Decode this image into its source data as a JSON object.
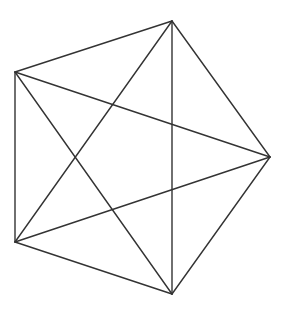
{
  "figure": {
    "stroke_color": "#333333",
    "background": "#ffffff",
    "vertices": [
      {
        "id": "A",
        "x": 172,
        "y": 21
      },
      {
        "id": "B",
        "x": 15,
        "y": 72
      },
      {
        "id": "C",
        "x": 15,
        "y": 242
      },
      {
        "id": "D",
        "x": 172,
        "y": 294
      },
      {
        "id": "E",
        "x": 270,
        "y": 157
      }
    ],
    "sides": [
      [
        "A",
        "B"
      ],
      [
        "B",
        "C"
      ],
      [
        "C",
        "D"
      ],
      [
        "D",
        "E"
      ],
      [
        "E",
        "A"
      ]
    ],
    "diagonals": [
      [
        "A",
        "C"
      ],
      [
        "A",
        "D"
      ],
      [
        "B",
        "D"
      ],
      [
        "B",
        "E"
      ],
      [
        "C",
        "E"
      ]
    ]
  }
}
